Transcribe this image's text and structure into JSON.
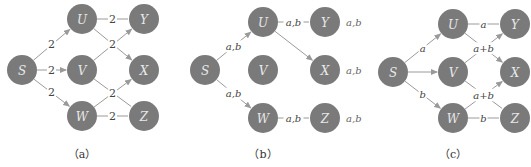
{
  "panels": [
    {
      "id": "a",
      "caption": "（a）",
      "offset_x": 0,
      "nodes": [
        {
          "id": "S",
          "label": "S",
          "x": 22,
          "y": 70
        },
        {
          "id": "U",
          "label": "U",
          "x": 82,
          "y": 19
        },
        {
          "id": "V",
          "label": "V",
          "x": 82,
          "y": 70
        },
        {
          "id": "W",
          "label": "W",
          "x": 82,
          "y": 116
        },
        {
          "id": "Y",
          "label": "Y",
          "x": 144,
          "y": 19
        },
        {
          "id": "X",
          "label": "X",
          "x": 144,
          "y": 70
        },
        {
          "id": "Z",
          "label": "Z",
          "x": 144,
          "y": 116
        }
      ],
      "edges": [
        {
          "from": "S",
          "to": "U",
          "label": "2",
          "arrow": true
        },
        {
          "from": "S",
          "to": "V",
          "label": "2",
          "arrow": true
        },
        {
          "from": "S",
          "to": "W",
          "label": "2",
          "arrow": true
        },
        {
          "from": "U",
          "to": "Y",
          "label": "2",
          "arrow": false
        },
        {
          "from": "U",
          "to": "X",
          "label": "2",
          "arrow": true
        },
        {
          "from": "V",
          "to": "Y",
          "label": "",
          "arrow": true
        },
        {
          "from": "V",
          "to": "Z",
          "label": "",
          "arrow": false
        },
        {
          "from": "W",
          "to": "X",
          "label": "2",
          "arrow": true
        },
        {
          "from": "W",
          "to": "Z",
          "label": "2",
          "arrow": false
        }
      ],
      "side_labels": []
    },
    {
      "id": "b",
      "caption": "（b）",
      "offset_x": 175,
      "nodes": [
        {
          "id": "S",
          "label": "S",
          "x": 30,
          "y": 70
        },
        {
          "id": "U",
          "label": "U",
          "x": 88,
          "y": 22
        },
        {
          "id": "V",
          "label": "V",
          "x": 88,
          "y": 70
        },
        {
          "id": "W",
          "label": "W",
          "x": 88,
          "y": 118
        },
        {
          "id": "Y",
          "label": "Y",
          "x": 150,
          "y": 22
        },
        {
          "id": "X",
          "label": "X",
          "x": 150,
          "y": 70
        },
        {
          "id": "Z",
          "label": "Z",
          "x": 150,
          "y": 118
        }
      ],
      "edges": [
        {
          "from": "S",
          "to": "U",
          "label": "a,b",
          "arrow": true
        },
        {
          "from": "S",
          "to": "W",
          "label": "a,b",
          "arrow": true
        },
        {
          "from": "U",
          "to": "Y",
          "label": "a,b",
          "arrow": false
        },
        {
          "from": "U",
          "to": "X",
          "label": "",
          "arrow": true
        },
        {
          "from": "W",
          "to": "Z",
          "label": "a,b",
          "arrow": false
        }
      ],
      "side_labels": [
        {
          "node": "Y",
          "text": "a,b"
        },
        {
          "node": "X",
          "text": "a,b"
        },
        {
          "node": "Z",
          "text": "a,b"
        }
      ]
    },
    {
      "id": "c",
      "caption": "（c）",
      "offset_x": 373,
      "nodes": [
        {
          "id": "S",
          "label": "S",
          "x": 20,
          "y": 72
        },
        {
          "id": "U",
          "label": "U",
          "x": 80,
          "y": 24
        },
        {
          "id": "V",
          "label": "V",
          "x": 80,
          "y": 72
        },
        {
          "id": "W",
          "label": "W",
          "x": 80,
          "y": 118
        },
        {
          "id": "Y",
          "label": "Y",
          "x": 142,
          "y": 24
        },
        {
          "id": "X",
          "label": "X",
          "x": 142,
          "y": 72
        },
        {
          "id": "Z",
          "label": "Z",
          "x": 142,
          "y": 118
        }
      ],
      "edges": [
        {
          "from": "S",
          "to": "U",
          "label": "a",
          "arrow": true
        },
        {
          "from": "S",
          "to": "V",
          "label": "",
          "arrow": true
        },
        {
          "from": "S",
          "to": "W",
          "label": "b",
          "arrow": true
        },
        {
          "from": "U",
          "to": "Y",
          "label": "a",
          "arrow": false
        },
        {
          "from": "U",
          "to": "X",
          "label": "",
          "arrow": true
        },
        {
          "from": "V",
          "to": "Y",
          "label": "a+b",
          "arrow": true
        },
        {
          "from": "V",
          "to": "Z",
          "label": "a+b",
          "arrow": false
        },
        {
          "from": "W",
          "to": "X",
          "label": "a+b",
          "arrow": true
        },
        {
          "from": "W",
          "to": "Z",
          "label": "b",
          "arrow": false
        }
      ],
      "side_labels": []
    }
  ],
  "style": {
    "node_fill": "#7a7a7a",
    "node_radius": 15,
    "edge_color": "#9a9a9a",
    "label_color": "#444444"
  }
}
